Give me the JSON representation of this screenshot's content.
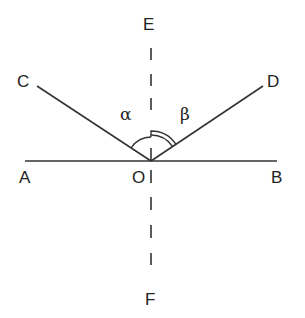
{
  "diagram": {
    "title": "",
    "points": {
      "A": "A",
      "B": "B",
      "C": "C",
      "D": "D",
      "E": "E",
      "F": "F",
      "O": "O"
    },
    "angles": {
      "alpha": "α",
      "beta": "β"
    },
    "colors": {
      "line": "#333333",
      "text": "#222222",
      "background": "#ffffff"
    }
  }
}
